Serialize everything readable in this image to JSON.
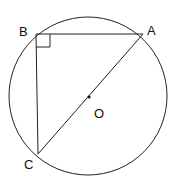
{
  "diagram": {
    "type": "circle-inscribed-right-triangle",
    "circle": {
      "center_label": "O",
      "cx": 88,
      "cy": 97,
      "r": 78
    },
    "points": {
      "A": {
        "label": "A",
        "x": 143,
        "y": 34
      },
      "B": {
        "label": "B",
        "x": 36,
        "y": 34
      },
      "C": {
        "label": "C",
        "x": 38,
        "y": 154
      }
    },
    "segments": [
      {
        "name": "segment-ba",
        "from": "B",
        "to": "A"
      },
      {
        "name": "segment-bc",
        "from": "B",
        "to": "C"
      },
      {
        "name": "segment-ac-diameter",
        "from": "A",
        "to": "C"
      }
    ],
    "right_angle_at": "B",
    "stroke_color": "#222222"
  }
}
